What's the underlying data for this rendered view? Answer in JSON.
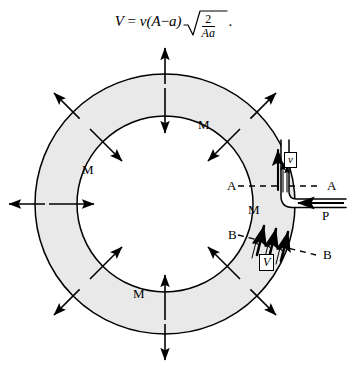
{
  "figure": {
    "title_formula": {
      "lhs": "V",
      "eq": "=",
      "rhs_prefix": "v(A",
      "minus": "−",
      "rhs_mid": "a)",
      "radicand_num": "2",
      "radicand_den": "Aa",
      "period": "."
    },
    "colors": {
      "annulus_fill": "#e9e9e9",
      "stroke": "#000000",
      "background": "#ffffff",
      "tube_fill": "#ffffff"
    },
    "geometry": {
      "center_x": 165,
      "center_y": 204,
      "outer_radius": 130,
      "inner_radius": 88
    },
    "labels": [
      {
        "name": "label-M-top-right",
        "text": "M",
        "x": 198,
        "y": 118
      },
      {
        "name": "label-M-left",
        "text": "M",
        "x": 82,
        "y": 163
      },
      {
        "name": "label-M-right",
        "text": "M",
        "x": 248,
        "y": 203
      },
      {
        "name": "label-M-bottom",
        "text": "M",
        "x": 133,
        "y": 287
      },
      {
        "name": "label-A-left",
        "text": "A",
        "x": 227,
        "y": 179
      },
      {
        "name": "label-A-right",
        "text": "A",
        "x": 327,
        "y": 179
      },
      {
        "name": "label-B-left",
        "text": "B",
        "x": 228,
        "y": 228
      },
      {
        "name": "label-B-right",
        "text": "B",
        "x": 323,
        "y": 255
      },
      {
        "name": "label-P",
        "text": "P",
        "x": 322,
        "y": 209
      }
    ],
    "boxed_labels": [
      {
        "name": "velocity-box-small-v",
        "text": "v",
        "x": 284,
        "y": 153
      },
      {
        "name": "velocity-box-capital-V",
        "text": "V",
        "x": 259,
        "y": 254
      }
    ],
    "section_lines": [
      {
        "name": "section-line-A-A",
        "label": "A",
        "y_left": 186,
        "y_right": 186
      },
      {
        "name": "section-line-B-B",
        "label": "B",
        "y_left": 236,
        "y_right": 253
      }
    ],
    "radial_arrows": {
      "count": 8,
      "angles_deg": [
        90,
        45,
        0,
        315,
        270,
        225,
        180,
        135
      ],
      "outward_on_outer_circle": true,
      "inward_on_inner_circle": true
    },
    "tube": {
      "name": "discharge-tube",
      "description": "narrow channel inside annulus, vertical then bends right and exits horizontally",
      "inflow_arrow_label": "P",
      "inflow_direction": "left"
    }
  }
}
